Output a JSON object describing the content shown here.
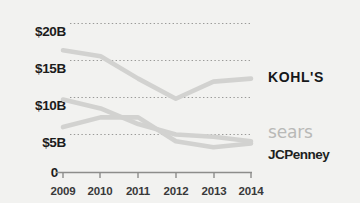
{
  "chart_data": {
    "type": "line",
    "title": "",
    "xlabel": "",
    "ylabel": "",
    "x": [
      "2009",
      "2010",
      "2011",
      "2012",
      "2013",
      "2014"
    ],
    "categories": [
      "2009",
      "2010",
      "2011",
      "2012",
      "2013",
      "2014"
    ],
    "ylim": [
      0,
      21.5
    ],
    "xlim": [
      2009,
      2014
    ],
    "grid": true,
    "grid_style": "dotted-horizontal",
    "legend_position": "right",
    "y_ticks": [
      {
        "value": 0,
        "label": "0"
      },
      {
        "value": 5,
        "label": "$5B"
      },
      {
        "value": 10,
        "label": "$10B"
      },
      {
        "value": 15,
        "label": "$15B"
      },
      {
        "value": 20,
        "label": "$20B"
      }
    ],
    "x_ticks": [
      {
        "value": 2009,
        "label": "2009"
      },
      {
        "value": 2010,
        "label": "2010"
      },
      {
        "value": 2011,
        "label": "2011"
      },
      {
        "value": 2012,
        "label": "2012"
      },
      {
        "value": 2013,
        "label": "2013"
      },
      {
        "value": 2014,
        "label": "2014"
      }
    ],
    "series": [
      {
        "name": "KOHL'S",
        "label": "KOHL'S",
        "color": "#d2d2d0",
        "values": [
          16.4,
          15.6,
          12.6,
          9.9,
          12.2,
          12.6
        ]
      },
      {
        "name": "sears",
        "label": "sears",
        "color": "#d2d2d0",
        "values": [
          9.8,
          8.6,
          6.5,
          5.1,
          4.8,
          4.2
        ]
      },
      {
        "name": "JCPenney",
        "label": "JCPenney",
        "color": "#d2d2d0",
        "values": [
          6.1,
          7.4,
          7.4,
          4.2,
          3.4,
          3.9
        ]
      }
    ]
  },
  "axis": {
    "y_labels": [
      "$20B",
      "$15B",
      "$10B",
      "$5B",
      "0"
    ],
    "x_labels": [
      "2009",
      "2010",
      "2011",
      "2012",
      "2013",
      "2014"
    ]
  },
  "legend": {
    "items": [
      {
        "label": "KOHL'S",
        "color": "#16181a"
      },
      {
        "label": "sears",
        "color": "#b9b9b7"
      },
      {
        "label": "JCPenney",
        "color": "#1d1f21"
      }
    ]
  },
  "colors": {
    "background": "#f2f2f0",
    "line": "#d2d2d0",
    "axis": "#8d8d8b",
    "gridline": "#9a9a98",
    "tick_text": "#39393a",
    "ylabel_text": "#1c1c1c"
  }
}
